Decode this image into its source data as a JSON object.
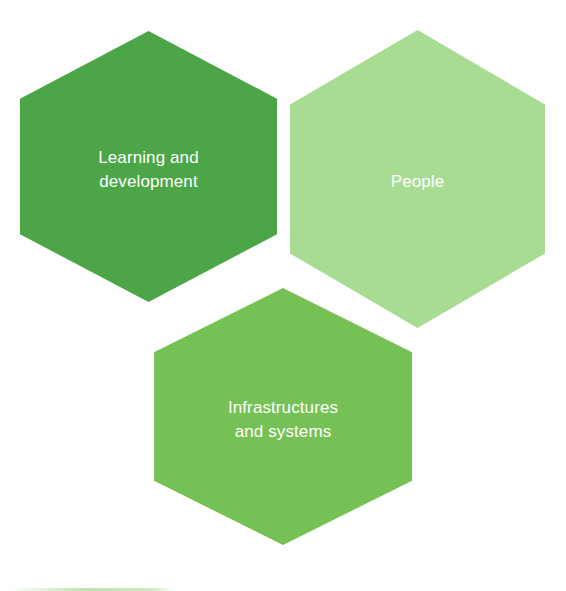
{
  "diagram": {
    "type": "hexagon-cluster",
    "background_color": "#ffffff",
    "label_color": "#ffffff",
    "nodes": [
      {
        "id": "learning-development",
        "label": "Learning and\ndevelopment",
        "color": "#4ca546",
        "shape": "hexagon",
        "position": "top-left"
      },
      {
        "id": "people",
        "label": "People",
        "color": "#a8dc92",
        "shape": "hexagon",
        "position": "top-right"
      },
      {
        "id": "infrastructures-systems",
        "label": "Infrastructures\nand systems",
        "color": "#76c155",
        "shape": "hexagon",
        "position": "bottom-center"
      }
    ]
  }
}
